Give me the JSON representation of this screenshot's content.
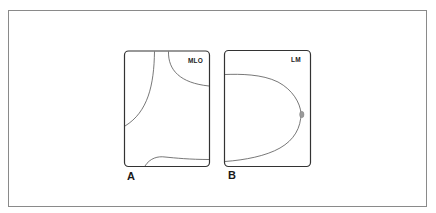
{
  "figure": {
    "panels": [
      {
        "id": "A",
        "caption": "A",
        "view_label": "MLO",
        "description": "Mediolateral oblique view outline"
      },
      {
        "id": "B",
        "caption": "B",
        "view_label": "LM",
        "description": "Lateromedial view outline"
      }
    ]
  },
  "colors": {
    "frame_border": "#8a8a8a",
    "panel_border": "#333333",
    "contour_line": "#555555",
    "nipple_fill": "#9a9a9a",
    "text": "#1a1a1a",
    "background": "#ffffff"
  }
}
